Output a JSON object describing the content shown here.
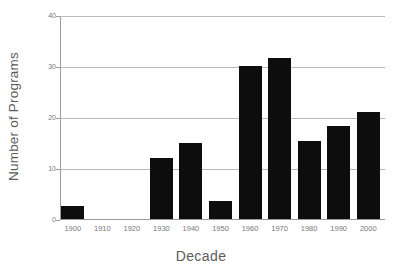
{
  "chart_data": {
    "type": "bar",
    "title": "",
    "xlabel": "Decade",
    "ylabel": "Number of Programs",
    "categories": [
      "1900",
      "1910",
      "1920",
      "1930",
      "1940",
      "1950",
      "1960",
      "1970",
      "1980",
      "1990",
      "2000"
    ],
    "values": [
      2.5,
      0,
      0,
      12,
      15,
      3.5,
      30,
      31.5,
      15.3,
      18.3,
      21
    ],
    "ylim": [
      0,
      40
    ],
    "yticks": [
      0,
      10,
      20,
      30,
      40
    ],
    "ytick_labels": [
      "0",
      "10",
      "20",
      "30",
      "40"
    ],
    "grid": "horizontal",
    "legend": "none",
    "bar_color": "#0d0d0d",
    "grid_color": "#b9b9bb",
    "axis_color": "#9a9a9c",
    "text_color": "#77777a",
    "background": "#ffffff"
  }
}
